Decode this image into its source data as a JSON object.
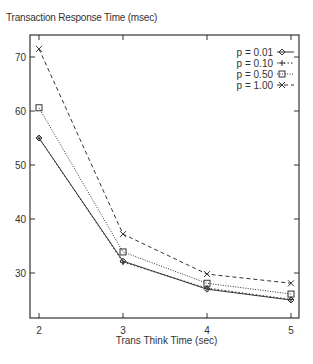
{
  "chart_data": {
    "type": "line",
    "title": "Transaction Response Time (msec)",
    "xlabel": "Trans Think Time (sec)",
    "ylabel": "Transaction Response Time (msec)",
    "x": [
      2,
      3,
      4,
      5
    ],
    "xlim": [
      1.9,
      5.1
    ],
    "ylim": [
      22,
      74.3
    ],
    "xticks": [
      2,
      3,
      4,
      5
    ],
    "yticks": [
      30,
      40,
      50,
      60,
      70
    ],
    "grid": false,
    "legend_position": "top-right",
    "series": [
      {
        "name": "p = 0.01",
        "marker": "diamond",
        "line": "solid",
        "values": [
          55.0,
          32.2,
          27.0,
          25.0
        ]
      },
      {
        "name": "p = 0.10",
        "marker": "plus",
        "line": "dotted",
        "values": [
          55.0,
          32.0,
          27.2,
          25.1
        ]
      },
      {
        "name": "p = 0.50",
        "marker": "square",
        "line": "dotted-fine",
        "values": [
          60.6,
          33.9,
          28.1,
          26.1
        ]
      },
      {
        "name": "p = 1.00",
        "marker": "x",
        "line": "dashed",
        "values": [
          71.5,
          37.2,
          29.8,
          28.1
        ]
      }
    ]
  }
}
